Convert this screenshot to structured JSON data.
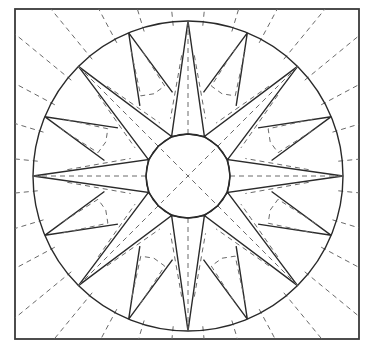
{
  "diagram": {
    "type": "line-art quilt block",
    "points": 16,
    "long_points": 8,
    "short_points": 8,
    "colors": {
      "background": "#ffffff",
      "line": "#2a2a2a",
      "border": "#3a3a3a",
      "quilting_dash": "#6a6a6a"
    },
    "geometry": {
      "square": {
        "x": 15,
        "y": 9,
        "width": 344,
        "height": 330
      },
      "center": {
        "x": 188,
        "y": 176
      },
      "outer_circle_radius": 155,
      "inner_circle_radius": 42,
      "long_point_half_angle_deg": 11.25,
      "short_point_base_radius": 85,
      "radial_dash_step_deg": 11.25
    }
  }
}
